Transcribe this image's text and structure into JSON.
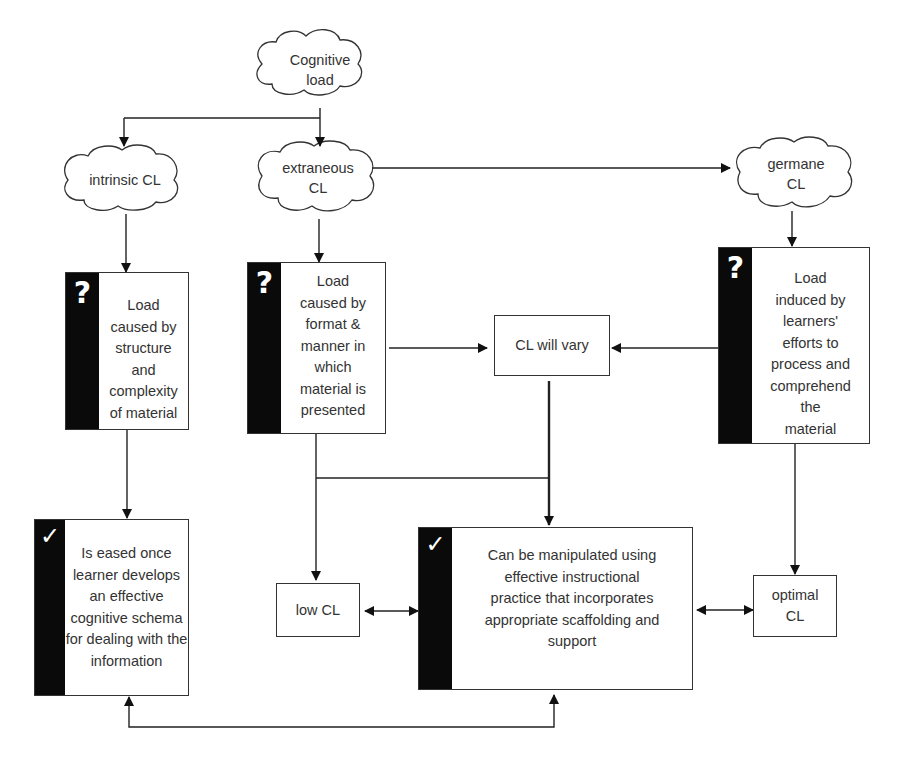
{
  "diagram": {
    "root": {
      "label": "Cognitive\nload",
      "line1": "Cognitive",
      "line2": "load"
    },
    "types": [
      {
        "id": "intrinsic",
        "line1": "intrinsic CL",
        "line2": ""
      },
      {
        "id": "extraneous",
        "line1": "extraneous",
        "line2": "CL"
      },
      {
        "id": "germane",
        "line1": "germane",
        "line2": "CL"
      }
    ],
    "descriptions": [
      {
        "id": "intrinsic-desc",
        "icon": "?",
        "icon_name": "question-mark-icon",
        "text": "Load caused by structure and complexity of material",
        "lines": [
          "Load",
          "caused by",
          "structure",
          "and",
          "complexity",
          "of material"
        ]
      },
      {
        "id": "extraneous-desc",
        "icon": "?",
        "icon_name": "question-mark-icon",
        "text": "Load caused by format & manner in which material is presented",
        "lines": [
          "Load",
          "caused by",
          "format &",
          "manner in",
          "which",
          "material is",
          "presented"
        ]
      },
      {
        "id": "germane-desc",
        "icon": "?",
        "icon_name": "question-mark-icon",
        "text": "Load induced by learners' efforts to process and comprehend the material",
        "lines": [
          "Load",
          "induced by",
          "learners'",
          "efforts to",
          "process and",
          "comprehend",
          "the",
          "material"
        ]
      }
    ],
    "vary": {
      "label": "CL will vary"
    },
    "outcomes": {
      "eased": {
        "icon": "✓",
        "icon_name": "checkmark-icon",
        "text": "Is eased once learner develops an effective cognitive schema for dealing with the information",
        "lines": [
          "Is eased once",
          "learner develops",
          "an effective",
          "cognitive schema",
          "for dealing with the",
          "information"
        ]
      },
      "manipulated": {
        "icon": "✓",
        "icon_name": "checkmark-icon",
        "text": "Can be manipulated using effective instructional practice that incorporates appropriate scaffolding and support",
        "lines": [
          "Can be manipulated using",
          "effective instructional",
          "practice that incorporates",
          "appropriate scaffolding and",
          "support"
        ]
      },
      "low": {
        "label": "low CL"
      },
      "optimal": {
        "line1": "optimal",
        "line2": "CL"
      }
    },
    "colors": {
      "line": "#222222",
      "bar": "#0a0a0a",
      "text": "#333333",
      "background": "#ffffff"
    }
  }
}
